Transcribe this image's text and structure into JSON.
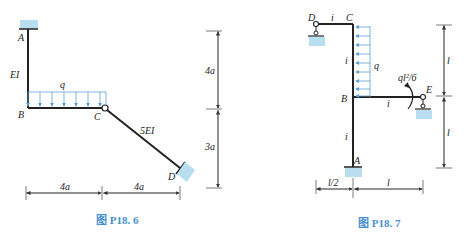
{
  "figures": [
    {
      "caption": "图 P18. 6",
      "nodes": {
        "A": "A",
        "B": "B",
        "C": "C",
        "D": "D"
      },
      "members": {
        "AB": "EI",
        "CD": "5EI"
      },
      "load": {
        "label": "q",
        "type": "distributed-downward"
      },
      "dims": {
        "h_top": "4a",
        "h_bottom": "3a",
        "w_left": "4a",
        "w_right": "4a"
      }
    },
    {
      "caption": "图 P18. 7",
      "nodes": {
        "A": "A",
        "B": "B",
        "C": "C",
        "D": "D",
        "E": "E"
      },
      "members": {
        "DC": "i",
        "CB": "i",
        "BA": "i",
        "BE": "i"
      },
      "load": {
        "label": "q",
        "type": "distributed-leftward"
      },
      "moment": {
        "label": "ql²/6"
      },
      "dims": {
        "h_top": "l",
        "h_bottom": "l",
        "w_left": "l/2",
        "w_right": "l"
      }
    }
  ],
  "colors": {
    "support": "#b8def0",
    "load": "#5aa0d8",
    "caption": "#4a8fd0",
    "member": "#222222",
    "dim": "#444444"
  }
}
